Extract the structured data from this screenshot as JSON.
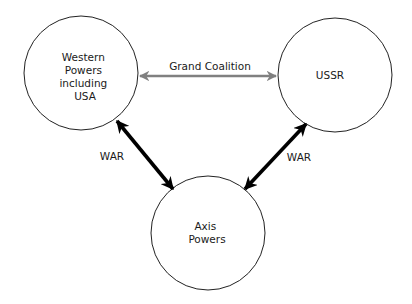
{
  "nodes": {
    "western": {
      "lines": [
        "Western",
        "Powers",
        "including",
        "USA"
      ]
    },
    "ussr": {
      "lines": [
        "USSR"
      ]
    },
    "axis": {
      "lines": [
        "Axis",
        "Powers"
      ]
    }
  },
  "edges": {
    "coalition": {
      "label": "Grand Coalition",
      "color": "#808080"
    },
    "war_left": {
      "label": "WAR",
      "color": "#000000"
    },
    "war_right": {
      "label": "WAR",
      "color": "#000000"
    }
  }
}
